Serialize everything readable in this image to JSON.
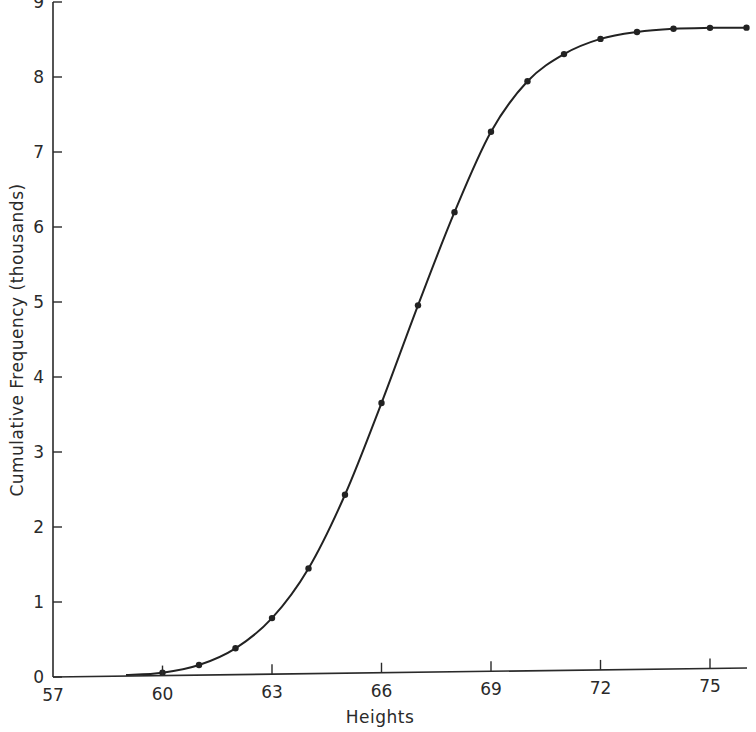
{
  "chart_data": {
    "type": "line",
    "title": "",
    "xlabel": "Heights",
    "ylabel": "Cumulative Frequency (thousands)",
    "xlim": [
      57,
      76
    ],
    "ylim": [
      0,
      9
    ],
    "grid": false,
    "legend": null,
    "x_ticks": [
      57,
      60,
      63,
      66,
      69,
      72,
      75
    ],
    "y_ticks": [
      0,
      1,
      2,
      3,
      4,
      5,
      6,
      7,
      8,
      9
    ],
    "x_tick_labels": [
      "57",
      "60",
      "63",
      "66",
      "69",
      "72",
      "75"
    ],
    "y_tick_labels": [
      "0",
      "1",
      "2",
      "3",
      "4",
      "5",
      "6",
      "7",
      "8",
      "9"
    ],
    "curve_start": [
      59,
      0
    ],
    "series": [
      {
        "name": "Cumulative frequency",
        "x": [
          60,
          61,
          62,
          63,
          64,
          65,
          66,
          67,
          68,
          69,
          70,
          71,
          72,
          73,
          74,
          75,
          76
        ],
        "values": [
          0.05,
          0.15,
          0.37,
          0.77,
          1.43,
          2.41,
          3.63,
          4.93,
          6.17,
          7.24,
          7.91,
          8.27,
          8.47,
          8.56,
          8.6,
          8.61,
          8.61
        ]
      }
    ],
    "colors": {
      "ink": "#222222",
      "background": "#ffffff"
    }
  }
}
